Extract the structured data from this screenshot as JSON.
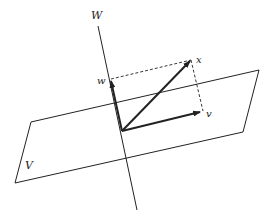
{
  "diagram": {
    "labels": {
      "subspace_w": "W",
      "plane_v": "V",
      "vector_x": "x",
      "vector_w": "w",
      "vector_v": "v"
    },
    "colors": {
      "stroke": "#222222",
      "background": "#ffffff"
    }
  }
}
